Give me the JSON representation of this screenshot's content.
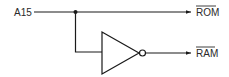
{
  "diagram": {
    "type": "logic-circuit",
    "input": {
      "label": "A15"
    },
    "outputs": [
      {
        "label": "ROM",
        "active_low": true,
        "via": "direct"
      },
      {
        "label": "RAM",
        "active_low": true,
        "via": "inverter"
      }
    ],
    "components": [
      {
        "type": "junction-dot"
      },
      {
        "type": "inverter",
        "symbol": "triangle-with-bubble"
      }
    ],
    "colors": {
      "line": "#1a1a1a",
      "text": "#2a2a2a",
      "background": "#ffffff"
    }
  }
}
